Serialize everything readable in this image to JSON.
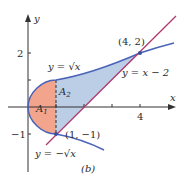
{
  "figure": {
    "caption": "(b)",
    "axes": {
      "x_label": "x",
      "y_label": "y",
      "x_ticks": [
        {
          "value": 1,
          "label": ""
        },
        {
          "value": 2,
          "label": ""
        },
        {
          "value": 3,
          "label": ""
        },
        {
          "value": 4,
          "label": "4"
        }
      ],
      "y_ticks": [
        {
          "value": 2,
          "label": "2"
        },
        {
          "value": 1,
          "label": ""
        },
        {
          "value": -1,
          "label": "−1"
        }
      ]
    },
    "curves": {
      "upper": {
        "label": "y = √x",
        "color": "#4a64b8"
      },
      "lower": {
        "label": "y = −√x",
        "color": "#4a64b8"
      },
      "line": {
        "label": "y = x − 2",
        "color": "#b03a6e"
      }
    },
    "points": [
      {
        "label": "(4, 2)",
        "x": 4,
        "y": 2
      },
      {
        "label": "(1, −1)",
        "x": 1,
        "y": -1
      }
    ],
    "regions": {
      "A1": {
        "label": "A",
        "sub": "1",
        "color": "#f0a08a"
      },
      "A2": {
        "label": "A",
        "sub": "2",
        "color": "#b9cbe4"
      }
    }
  }
}
